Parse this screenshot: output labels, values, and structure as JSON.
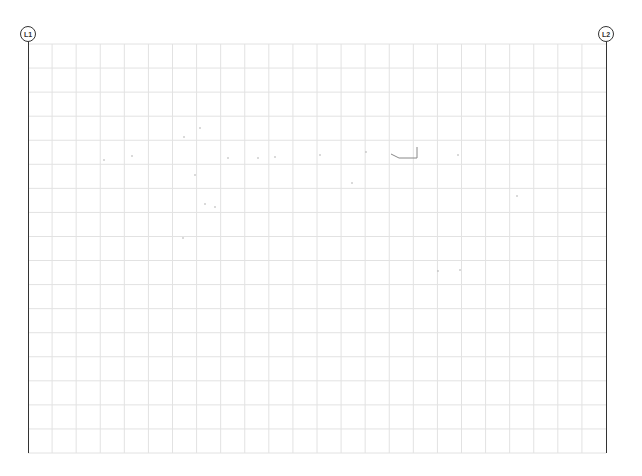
{
  "drawing": {
    "type": "structural grid plan",
    "grid": {
      "left_x": 28,
      "right_x": 606,
      "top_y": 44,
      "bottom_y": 453,
      "columns": 24,
      "rows": 17,
      "line_color": "#e2e2e2",
      "axis_color": "#333333"
    },
    "gridlines": [
      {
        "label": "L1",
        "x": 28
      },
      {
        "label": "L2",
        "x": 606
      }
    ],
    "marks": [
      {
        "type": "polyline",
        "points": [
          [
            391,
            154
          ],
          [
            399,
            158
          ],
          [
            417,
            158
          ],
          [
            417,
            147
          ]
        ],
        "color": "#888888"
      },
      {
        "type": "speck",
        "x": 104,
        "y": 160
      },
      {
        "type": "speck",
        "x": 132,
        "y": 156
      },
      {
        "type": "speck",
        "x": 184,
        "y": 137
      },
      {
        "type": "speck",
        "x": 200,
        "y": 128
      },
      {
        "type": "speck",
        "x": 195,
        "y": 175
      },
      {
        "type": "speck",
        "x": 205,
        "y": 204
      },
      {
        "type": "speck",
        "x": 215,
        "y": 207
      },
      {
        "type": "speck",
        "x": 183,
        "y": 238
      },
      {
        "type": "speck",
        "x": 228,
        "y": 158
      },
      {
        "type": "speck",
        "x": 258,
        "y": 158
      },
      {
        "type": "speck",
        "x": 275,
        "y": 157
      },
      {
        "type": "speck",
        "x": 320,
        "y": 155
      },
      {
        "type": "speck",
        "x": 366,
        "y": 152
      },
      {
        "type": "speck",
        "x": 458,
        "y": 155
      },
      {
        "type": "speck",
        "x": 352,
        "y": 183
      },
      {
        "type": "speck",
        "x": 438,
        "y": 271
      },
      {
        "type": "speck",
        "x": 460,
        "y": 270
      },
      {
        "type": "speck",
        "x": 517,
        "y": 196
      }
    ]
  }
}
